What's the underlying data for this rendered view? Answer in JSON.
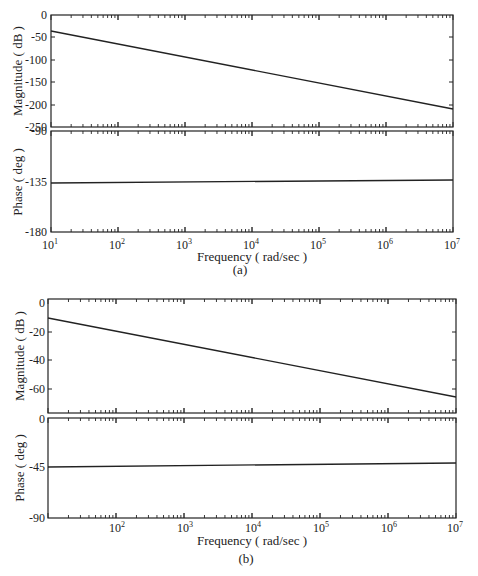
{
  "page": {
    "top_note": "a. Bode diagrams of the figure"
  },
  "figures": [
    {
      "caption": "(a)",
      "xlabel": "Frequency ( rad/sec )",
      "x_ticks": [
        "10",
        "10",
        "10",
        "10",
        "10",
        "10",
        "10"
      ],
      "x_exponents": [
        "1",
        "2",
        "3",
        "4",
        "5",
        "6",
        "7"
      ],
      "magnitude": {
        "ylabel": "Magnitude ( dB )",
        "y_ticks": [
          "0",
          "-50",
          "-100",
          "-150",
          "-200",
          "-250"
        ]
      },
      "phase": {
        "ylabel": "Phase ( deg )",
        "y_ticks": [
          "-90",
          "-135",
          "-180"
        ]
      }
    },
    {
      "caption": "(b)",
      "xlabel": "Frequency ( rad/sec )",
      "x_ticks": [
        "10",
        "10",
        "10",
        "10",
        "10",
        "10"
      ],
      "x_exponents": [
        "2",
        "3",
        "4",
        "5",
        "6",
        "7"
      ],
      "magnitude": {
        "ylabel": "Magnitude ( dB )",
        "y_ticks": [
          "0",
          "-20",
          "-40",
          "-60"
        ]
      },
      "phase": {
        "ylabel": "Phase ( deg )",
        "y_ticks": [
          "0",
          "-45",
          "-90"
        ]
      }
    }
  ],
  "chart_data": [
    {
      "type": "line",
      "title": "(a) Bode magnitude",
      "xlabel": "Frequency ( rad/sec )",
      "ylabel": "Magnitude ( dB )",
      "xscale": "log",
      "xlim": [
        10,
        10000000
      ],
      "ylim": [
        -250,
        0
      ],
      "x": [
        10,
        10000000
      ],
      "series": [
        {
          "name": "Magnitude",
          "values": [
            -35,
            -207
          ]
        }
      ]
    },
    {
      "type": "line",
      "title": "(a) Bode phase",
      "xlabel": "Frequency ( rad/sec )",
      "ylabel": "Phase ( deg )",
      "xscale": "log",
      "xlim": [
        10,
        10000000
      ],
      "ylim": [
        -180,
        -90
      ],
      "x": [
        10,
        10000000
      ],
      "series": [
        {
          "name": "Phase",
          "values": [
            -135,
            -133
          ]
        }
      ]
    },
    {
      "type": "line",
      "title": "(b) Bode magnitude",
      "xlabel": "Frequency ( rad/sec )",
      "ylabel": "Magnitude ( dB )",
      "xscale": "log",
      "xlim": [
        10,
        10000000
      ],
      "ylim": [
        -78,
        0
      ],
      "x": [
        10,
        10000000
      ],
      "series": [
        {
          "name": "Magnitude",
          "values": [
            -10,
            -66
          ]
        }
      ]
    },
    {
      "type": "line",
      "title": "(b) Bode phase",
      "xlabel": "Frequency ( rad/sec )",
      "ylabel": "Phase ( deg )",
      "xscale": "log",
      "xlim": [
        10,
        10000000
      ],
      "ylim": [
        -90,
        0
      ],
      "x": [
        10,
        10000000
      ],
      "series": [
        {
          "name": "Phase",
          "values": [
            -44,
            -42
          ]
        }
      ]
    }
  ]
}
